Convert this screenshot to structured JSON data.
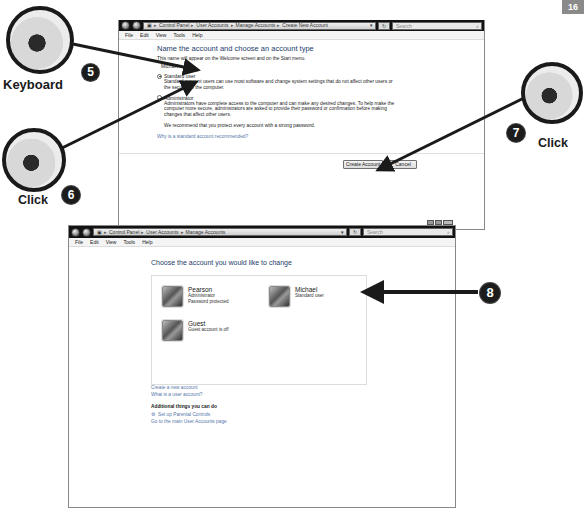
{
  "page_tab": "16",
  "window_create": {
    "breadcrumb": [
      "Control Panel",
      "User Accounts",
      "Manage Accounts",
      "Create New Account"
    ],
    "search_placeholder": "Search",
    "menu": [
      "File",
      "Edit",
      "View",
      "Tools",
      "Help"
    ],
    "heading": "Name the account and choose an account type",
    "name_hint": "This name will appear on the Welcome screen and on the Start menu.",
    "name_value": "Michael",
    "options": [
      {
        "label": "Standard user",
        "selected": true,
        "description": "Standard account users can use most software and change system settings that do not affect other users or the security of the computer."
      },
      {
        "label": "Administrator",
        "selected": false,
        "description": "Administrators have complete access to the computer and can make any desired changes. To help make the computer more secure, administrators are asked to provide their password or confirmation before making changes that affect other users."
      }
    ],
    "recommendation": "We recommend that you protect every account with a strong password.",
    "why_link": "Why is a standard account recommended?",
    "create_button": "Create Account",
    "cancel_button": "Cancel"
  },
  "window_manage": {
    "breadcrumb": [
      "Control Panel",
      "User Accounts",
      "Manage Accounts"
    ],
    "search_placeholder": "Search",
    "menu": [
      "File",
      "Edit",
      "View",
      "Tools",
      "Help"
    ],
    "heading": "Choose the account you would like to change",
    "accounts": [
      {
        "name": "Pearson",
        "lines": [
          "Administrator",
          "Password protected"
        ]
      },
      {
        "name": "Michael",
        "lines": [
          "Standard user"
        ]
      },
      {
        "name": "Guest",
        "lines": [
          "Guest account is off"
        ]
      }
    ],
    "links": [
      "Create a new account",
      "What is a user account?"
    ],
    "additional_heading": "Additional things you can do",
    "additional_links": [
      "Set up Parental Controls",
      "Go to the main User Accounts page"
    ]
  },
  "annotations": {
    "step5": {
      "number": "5",
      "label": "Keyboard"
    },
    "step6": {
      "number": "6",
      "label": "Click"
    },
    "step7": {
      "number": "7",
      "label": "Click"
    },
    "step8": {
      "number": "8"
    }
  }
}
